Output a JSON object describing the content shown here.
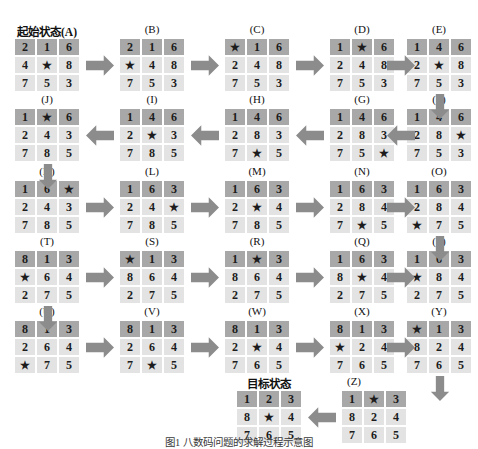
{
  "figure": {
    "caption": "图1  八数码问题的求解过程示意图",
    "start_label": "起始状态(A)",
    "goal_label": "目标状态",
    "blank_symbol": "★",
    "colors": {
      "cell_dark": "#a8a8a8",
      "cell_light": "#e3e3e3",
      "arrow": "#8c8c8c",
      "text": "#1c1c1c",
      "background": "#ffffff"
    }
  },
  "states": [
    {
      "id": "A",
      "label": "起始状态(A)",
      "rows": [
        [
          "2",
          "1",
          "6"
        ],
        [
          "4",
          "★",
          "8"
        ],
        [
          "7",
          "5",
          "3"
        ]
      ]
    },
    {
      "id": "B",
      "label": "(B)",
      "rows": [
        [
          "2",
          "1",
          "6"
        ],
        [
          "★",
          "4",
          "8"
        ],
        [
          "7",
          "5",
          "3"
        ]
      ]
    },
    {
      "id": "C",
      "label": "(C)",
      "rows": [
        [
          "★",
          "1",
          "6"
        ],
        [
          "2",
          "4",
          "8"
        ],
        [
          "7",
          "5",
          "3"
        ]
      ]
    },
    {
      "id": "D",
      "label": "(D)",
      "rows": [
        [
          "1",
          "★",
          "6"
        ],
        [
          "2",
          "4",
          "8"
        ],
        [
          "7",
          "5",
          "3"
        ]
      ]
    },
    {
      "id": "E",
      "label": "(E)",
      "rows": [
        [
          "1",
          "4",
          "6"
        ],
        [
          "2",
          "★",
          "8"
        ],
        [
          "7",
          "5",
          "3"
        ]
      ]
    },
    {
      "id": "F",
      "label": "(F)",
      "rows": [
        [
          "1",
          "4",
          "6"
        ],
        [
          "2",
          "8",
          "★"
        ],
        [
          "7",
          "5",
          "3"
        ]
      ]
    },
    {
      "id": "G",
      "label": "(G)",
      "rows": [
        [
          "1",
          "4",
          "6"
        ],
        [
          "2",
          "8",
          "3"
        ],
        [
          "7",
          "5",
          "★"
        ]
      ]
    },
    {
      "id": "H",
      "label": "(H)",
      "rows": [
        [
          "1",
          "4",
          "6"
        ],
        [
          "2",
          "8",
          "3"
        ],
        [
          "7",
          "★",
          "5"
        ]
      ]
    },
    {
      "id": "I",
      "label": "(I)",
      "rows": [
        [
          "1",
          "4",
          "6"
        ],
        [
          "2",
          "★",
          "3"
        ],
        [
          "7",
          "8",
          "5"
        ]
      ]
    },
    {
      "id": "J",
      "label": "(J)",
      "rows": [
        [
          "1",
          "★",
          "6"
        ],
        [
          "2",
          "4",
          "3"
        ],
        [
          "7",
          "8",
          "5"
        ]
      ]
    },
    {
      "id": "K",
      "label": "(K)",
      "rows": [
        [
          "1",
          "6",
          "★"
        ],
        [
          "2",
          "4",
          "3"
        ],
        [
          "7",
          "8",
          "5"
        ]
      ]
    },
    {
      "id": "L",
      "label": "(L)",
      "rows": [
        [
          "1",
          "6",
          "3"
        ],
        [
          "2",
          "4",
          "★"
        ],
        [
          "7",
          "8",
          "5"
        ]
      ]
    },
    {
      "id": "M",
      "label": "(M)",
      "rows": [
        [
          "1",
          "6",
          "3"
        ],
        [
          "2",
          "★",
          "4"
        ],
        [
          "7",
          "8",
          "5"
        ]
      ]
    },
    {
      "id": "N",
      "label": "(N)",
      "rows": [
        [
          "1",
          "6",
          "3"
        ],
        [
          "2",
          "8",
          "4"
        ],
        [
          "7",
          "★",
          "5"
        ]
      ]
    },
    {
      "id": "O",
      "label": "(O)",
      "rows": [
        [
          "1",
          "6",
          "3"
        ],
        [
          "2",
          "8",
          "4"
        ],
        [
          "★",
          "7",
          "5"
        ]
      ]
    },
    {
      "id": "P",
      "label": "(P)",
      "rows": [
        [
          "1",
          "6",
          "3"
        ],
        [
          "★",
          "8",
          "4"
        ],
        [
          "2",
          "7",
          "5"
        ]
      ]
    },
    {
      "id": "Q",
      "label": "(Q)",
      "rows": [
        [
          "1",
          "6",
          "3"
        ],
        [
          "8",
          "★",
          "4"
        ],
        [
          "2",
          "7",
          "5"
        ]
      ]
    },
    {
      "id": "R",
      "label": "(R)",
      "rows": [
        [
          "1",
          "★",
          "3"
        ],
        [
          "8",
          "6",
          "4"
        ],
        [
          "2",
          "7",
          "5"
        ]
      ]
    },
    {
      "id": "S",
      "label": "(S)",
      "rows": [
        [
          "★",
          "1",
          "3"
        ],
        [
          "8",
          "6",
          "4"
        ],
        [
          "2",
          "7",
          "5"
        ]
      ]
    },
    {
      "id": "T",
      "label": "(T)",
      "rows": [
        [
          "8",
          "1",
          "3"
        ],
        [
          "★",
          "6",
          "4"
        ],
        [
          "2",
          "7",
          "5"
        ]
      ]
    },
    {
      "id": "U",
      "label": "(U)",
      "rows": [
        [
          "8",
          "1",
          "3"
        ],
        [
          "2",
          "6",
          "4"
        ],
        [
          "★",
          "7",
          "5"
        ]
      ]
    },
    {
      "id": "V",
      "label": "(V)",
      "rows": [
        [
          "8",
          "1",
          "3"
        ],
        [
          "2",
          "6",
          "4"
        ],
        [
          "7",
          "★",
          "5"
        ]
      ]
    },
    {
      "id": "W",
      "label": "(W)",
      "rows": [
        [
          "8",
          "1",
          "3"
        ],
        [
          "2",
          "★",
          "4"
        ],
        [
          "7",
          "6",
          "5"
        ]
      ]
    },
    {
      "id": "X",
      "label": "(X)",
      "rows": [
        [
          "8",
          "1",
          "3"
        ],
        [
          "★",
          "2",
          "4"
        ],
        [
          "7",
          "6",
          "5"
        ]
      ]
    },
    {
      "id": "Y",
      "label": "(Y)",
      "rows": [
        [
          "★",
          "1",
          "3"
        ],
        [
          "8",
          "2",
          "4"
        ],
        [
          "7",
          "6",
          "5"
        ]
      ]
    },
    {
      "id": "Z",
      "label": "(Z)",
      "rows": [
        [
          "1",
          "★",
          "3"
        ],
        [
          "8",
          "2",
          "4"
        ],
        [
          "7",
          "6",
          "5"
        ]
      ]
    },
    {
      "id": "GOAL",
      "label": "目标状态",
      "rows": [
        [
          "1",
          "2",
          "3"
        ],
        [
          "8",
          "★",
          "4"
        ],
        [
          "7",
          "6",
          "5"
        ]
      ]
    }
  ]
}
